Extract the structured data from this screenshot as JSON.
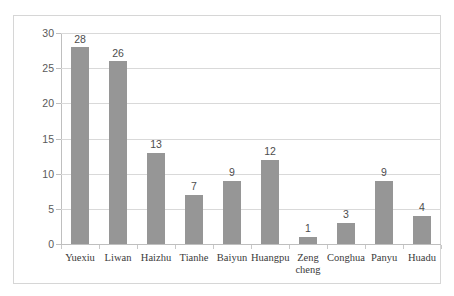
{
  "chart_data": {
    "type": "bar",
    "title": "",
    "subtitle": "",
    "xlabel": "",
    "ylabel": "",
    "categories": [
      "Yuexiu",
      "Liwan",
      "Haizhu",
      "Tianhe",
      "Baiyun",
      "Huangpu",
      "Zeng cheng",
      "Conghua",
      "Panyu",
      "Huadu"
    ],
    "values": [
      28,
      26,
      13,
      7,
      9,
      12,
      1,
      3,
      9,
      4
    ],
    "data_labels": [
      "28",
      "26",
      "13",
      "7",
      "9",
      "12",
      "1",
      "3",
      "9",
      "4"
    ],
    "ylim": [
      0,
      30
    ],
    "ytick_values": [
      0,
      5,
      10,
      15,
      20,
      25,
      30
    ],
    "ytick_labels": [
      "0",
      "5",
      "10",
      "15",
      "20",
      "25",
      "30"
    ],
    "grid": "horizontal",
    "legend": "none",
    "colors": {
      "bar": "#969696",
      "gridline": "#d9d9d9",
      "axis": "#bfbfbf",
      "frame": "#d6d6d6",
      "value_text": "#4d4d4d",
      "tick_text": "#5a5a5a",
      "category_text": "#3a3a3a",
      "background": "#ffffff"
    }
  }
}
